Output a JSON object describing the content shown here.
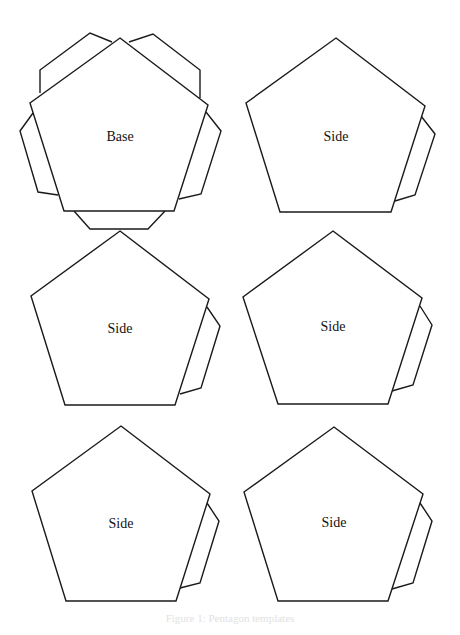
{
  "colors": {
    "stroke": "#1a1a1a",
    "fill": "#ffffff",
    "caption": "#e2e2e2"
  },
  "pieces": [
    {
      "label": "Base",
      "label_pos": [
        120,
        141
      ],
      "pentagon": [
        [
          120,
          38
        ],
        [
          208,
          105
        ],
        [
          174,
          211
        ],
        [
          64,
          211
        ],
        [
          30,
          103
        ]
      ],
      "flaps": [
        [
          [
            40,
            93
          ],
          [
            40,
            70
          ],
          [
            90,
            33
          ],
          [
            112,
            42
          ]
        ],
        [
          [
            129,
            42
          ],
          [
            153,
            34
          ],
          [
            200,
            70
          ],
          [
            200,
            98
          ]
        ],
        [
          [
            33,
            113
          ],
          [
            20,
            131
          ],
          [
            38,
            192
          ],
          [
            58,
            195
          ]
        ],
        [
          [
            206,
            112
          ],
          [
            221,
            131
          ],
          [
            201,
            194
          ],
          [
            179,
            199
          ]
        ],
        [
          [
            74,
            211
          ],
          [
            90,
            229
          ],
          [
            148,
            229
          ],
          [
            165,
            211
          ]
        ]
      ]
    },
    {
      "label": "Side",
      "label_pos": [
        336,
        141
      ],
      "pentagon": [
        [
          336,
          38
        ],
        [
          425,
          106
        ],
        [
          391,
          212
        ],
        [
          280,
          212
        ],
        [
          246,
          103
        ]
      ],
      "flaps": [
        [
          [
            421,
            116
          ],
          [
            435,
            134
          ],
          [
            415,
            195
          ],
          [
            395,
            201
          ]
        ]
      ]
    },
    {
      "label": "Side",
      "label_pos": [
        120,
        333
      ],
      "pentagon": [
        [
          120,
          231
        ],
        [
          209,
          299
        ],
        [
          175,
          405
        ],
        [
          65,
          405
        ],
        [
          31,
          296
        ]
      ],
      "flaps": [
        [
          [
            207,
            307
          ],
          [
            220,
            326
          ],
          [
            201,
            388
          ],
          [
            180,
            394
          ]
        ]
      ]
    },
    {
      "label": "Side",
      "label_pos": [
        333,
        331
      ],
      "pentagon": [
        [
          333,
          231
        ],
        [
          422,
          298
        ],
        [
          388,
          404
        ],
        [
          278,
          404
        ],
        [
          243,
          297
        ]
      ],
      "flaps": [
        [
          [
            420,
            306
          ],
          [
            432,
            325
          ],
          [
            413,
            385
          ],
          [
            392,
            391
          ]
        ]
      ]
    },
    {
      "label": "Side",
      "label_pos": [
        121,
        528
      ],
      "pentagon": [
        [
          121,
          426
        ],
        [
          210,
          494
        ],
        [
          176,
          601
        ],
        [
          66,
          601
        ],
        [
          32,
          491
        ]
      ],
      "flaps": [
        [
          [
            207,
            503
          ],
          [
            219,
            521
          ],
          [
            200,
            583
          ],
          [
            180,
            588
          ]
        ]
      ]
    },
    {
      "label": "Side",
      "label_pos": [
        334,
        527
      ],
      "pentagon": [
        [
          334,
          427
        ],
        [
          423,
          494
        ],
        [
          388,
          601
        ],
        [
          278,
          601
        ],
        [
          244,
          492
        ]
      ],
      "flaps": [
        [
          [
            420,
            503
          ],
          [
            432,
            521
          ],
          [
            413,
            583
          ],
          [
            392,
            589
          ]
        ]
      ]
    }
  ],
  "caption": "Figure 1: Pentagon templates"
}
